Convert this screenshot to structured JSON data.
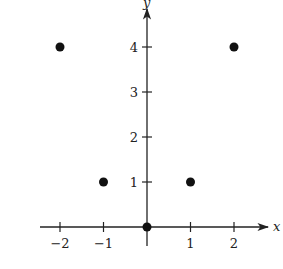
{
  "chart_data": {
    "type": "scatter",
    "title": "",
    "xlabel": "x",
    "ylabel": "y",
    "x": [
      -2,
      -1,
      0,
      1,
      2
    ],
    "y": [
      4,
      1,
      0,
      1,
      4
    ],
    "points": [
      {
        "x": -2,
        "y": 4
      },
      {
        "x": -1,
        "y": 1
      },
      {
        "x": 0,
        "y": 0
      },
      {
        "x": 1,
        "y": 1
      },
      {
        "x": 2,
        "y": 4
      }
    ],
    "x_ticks": [
      -2,
      -1,
      1,
      2
    ],
    "x_tick_labels": [
      "−2",
      "−1",
      "1",
      "2"
    ],
    "y_ticks": [
      1,
      2,
      3,
      4
    ],
    "y_tick_labels": [
      "1",
      "2",
      "3",
      "4"
    ],
    "xlim": [
      -2.5,
      2.8
    ],
    "ylim": [
      -0.4,
      4.9
    ],
    "grid": false,
    "legend": null,
    "marker_color": "#111111",
    "axis_color": "#222222"
  }
}
